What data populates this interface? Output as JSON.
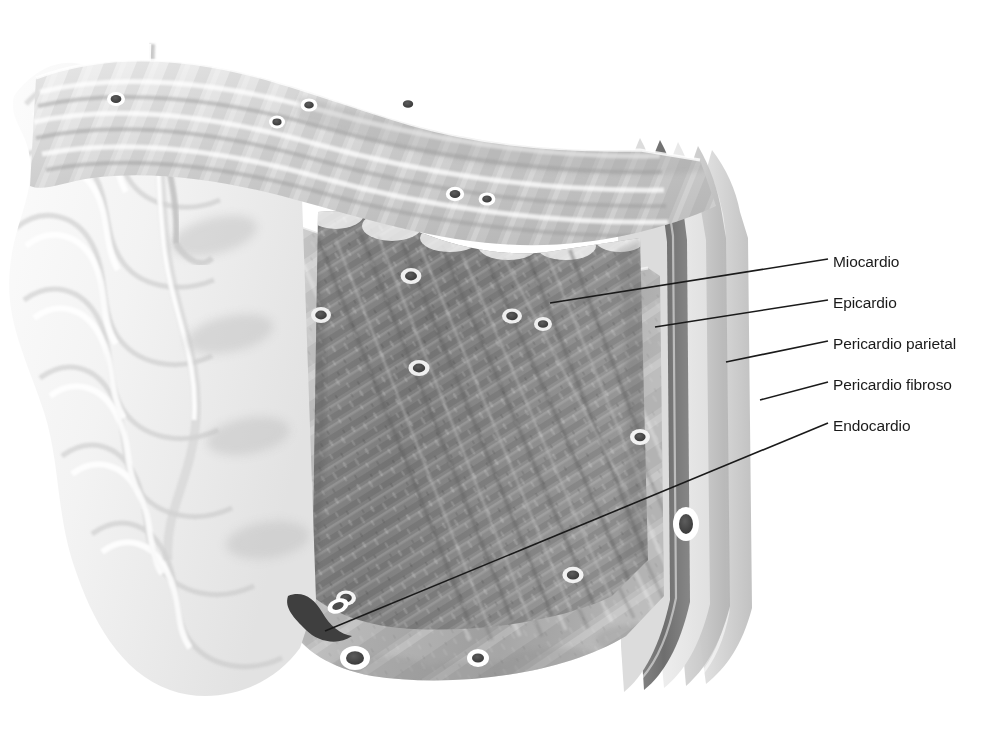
{
  "figure": {
    "title": "Pared cardiaca normal",
    "title_visible_fragment": true,
    "width": 991,
    "height": 745,
    "background_color": "#ffffff",
    "style": "ilustracion medica en escala de grises"
  },
  "callouts": [
    {
      "id": "miocardio",
      "label": "Miocardio",
      "label_x": 833,
      "label_y": 265,
      "line": {
        "x1": 550,
        "y1": 303,
        "x2": 828,
        "y2": 259
      },
      "target": "cara seccionada del musculo cardiaco"
    },
    {
      "id": "epicardio",
      "label": "Epicardio",
      "label_y": 306,
      "label_x": 833,
      "line": {
        "x1": 655,
        "y1": 327,
        "x2": 828,
        "y2": 300
      },
      "target": "lamina visceral serosa sobre el miocardio"
    },
    {
      "id": "pericardio-parietal",
      "label": "Pericardio parietal",
      "label_x": 833,
      "label_y": 347,
      "line": {
        "x1": 726,
        "y1": 362,
        "x2": 828,
        "y2": 341
      },
      "target": "lamina parietal serosa del pericardio"
    },
    {
      "id": "pericardio-fibroso",
      "label": "Pericardio fibroso",
      "label_x": 833,
      "label_y": 388,
      "line": {
        "x1": 760,
        "y1": 400,
        "x2": 828,
        "y2": 382
      },
      "target": "capa fibrosa externa del pericardio"
    },
    {
      "id": "endocardio",
      "label": "Endocardio",
      "label_x": 833,
      "label_y": 429,
      "line": {
        "x1": 325,
        "y1": 631,
        "x2": 828,
        "y2": 423
      },
      "target": "revestimiento interno trabeculado de la camara"
    }
  ],
  "wall_layers": [
    {
      "name": "Endocardio",
      "tone": "#f2f2f2",
      "position": "interior, superficie trabeculada izquierda"
    },
    {
      "name": "Miocardio",
      "tone": "#8e8e8e",
      "position": "capa media gruesa, cara de corte oscura"
    },
    {
      "name": "Epicardio",
      "tone": "#6a6a6a",
      "position": "banda delgada oscura sobre el miocardio"
    },
    {
      "name": "Cavidad pericardica",
      "tone": "#e8e8e8",
      "position": "espacio claro entre laminas serosas"
    },
    {
      "name": "Pericardio parietal",
      "tone": "#c9c9c9",
      "position": "banda clara externa interna"
    },
    {
      "name": "Pericardio fibroso",
      "tone": "#d8d8d8",
      "position": "banda mas externa del borde derecho"
    }
  ],
  "palette": {
    "line": "#1a1a1a",
    "text": "#1a1a1a",
    "background": "#ffffff",
    "muscle_dark": "#7c7c7c",
    "muscle_mid": "#a2a2a2",
    "muscle_light": "#c4c4c4",
    "endocardium_light": "#f4f4f4",
    "vessel_dark": "#4a4a4a"
  },
  "features": {
    "vessels_label": "secciones transversales de vasos coronarios",
    "vessel_count_visible": 16,
    "fiber_direction": "haces musculares oblicuos descendentes hacia la derecha",
    "cut_face": "cara anterior seccionada del miocardio",
    "top_surface": "superficie epicardica superior con bandas fibrosas"
  }
}
